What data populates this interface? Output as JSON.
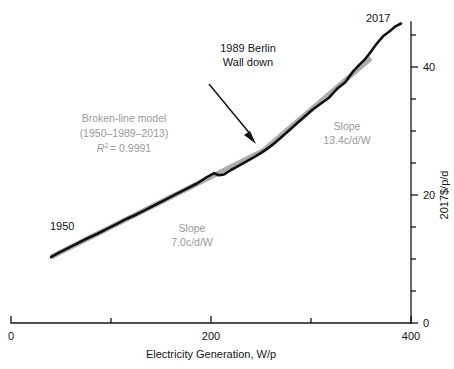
{
  "chart_data": {
    "type": "line",
    "title": "",
    "xlabel": "Electricity Generation, W/p",
    "ylabel": "2017$/p/d",
    "xlim": [
      0,
      400
    ],
    "ylim": [
      0,
      47
    ],
    "grid": false,
    "legend_position": "none",
    "x_ticks_major": [
      0,
      200,
      400
    ],
    "x_tick_labels_major": [
      "0",
      "200",
      "400"
    ],
    "x_ticks_minor": [
      100,
      300
    ],
    "y_ticks_major": [
      0,
      20,
      40
    ],
    "y_tick_labels_major": [
      "0",
      "20",
      "40"
    ],
    "y_ticks_minor": [
      5,
      10,
      15,
      25,
      30,
      35,
      45
    ],
    "y_axis_side": "right",
    "series": [
      {
        "name": "Observed trajectory",
        "color": "#111111",
        "style": "solid",
        "x": [
          40,
          48,
          57,
          66,
          76,
          86,
          96,
          106,
          116,
          126,
          136,
          146,
          156,
          166,
          176,
          186,
          196,
          203,
          208,
          213,
          220,
          228,
          236,
          244,
          250,
          256,
          262,
          270,
          278,
          286,
          294,
          302,
          310,
          318,
          326,
          334,
          342,
          348,
          354,
          360,
          366,
          372,
          378,
          384,
          390
        ],
        "y": [
          10.3,
          11.0,
          11.7,
          12.4,
          13.2,
          13.9,
          14.7,
          15.5,
          16.3,
          17.0,
          17.8,
          18.6,
          19.4,
          20.2,
          21.0,
          21.8,
          22.8,
          23.4,
          23.1,
          23.2,
          23.9,
          24.6,
          25.3,
          26.0,
          26.6,
          27.2,
          27.9,
          29.0,
          30.1,
          31.2,
          32.3,
          33.4,
          34.3,
          35.2,
          36.6,
          37.6,
          39.3,
          40.3,
          41.2,
          42.4,
          43.7,
          44.8,
          45.5,
          46.3,
          46.8
        ]
      },
      {
        "name": "Broken-line model",
        "color": "#adadad",
        "style": "solid",
        "breakpoints_x": [
          40,
          252,
          360
        ],
        "breakpoints_y": [
          10.3,
          26.9,
          41.4
        ],
        "x": [
          40,
          252,
          360
        ],
        "y": [
          10.3,
          26.9,
          41.4
        ]
      }
    ],
    "annotations": [
      {
        "name": "start-year-label",
        "text": "1950",
        "x": 48,
        "y": 14.8
      },
      {
        "name": "end-year-label",
        "text": "2017",
        "x": 370,
        "y": 47.5
      },
      {
        "name": "berlin-wall-callout",
        "text_lines": [
          "1989 Berlin",
          "Wall down"
        ],
        "arrow_from": [
          198,
          37.5
        ],
        "arrow_to": [
          248,
          28.6
        ]
      },
      {
        "name": "model-annotation",
        "text_lines": [
          "Broken-line model",
          "(1950–1989–2013)",
          "R² = 0.9991"
        ],
        "r_squared": "0.9991",
        "period": "(1950–1989–2013)",
        "color": "#9a9a9a"
      },
      {
        "name": "slope-label-lower",
        "text_lines": [
          "Slope",
          "7.0c/d/W"
        ],
        "value": "7.0c/d/W",
        "color": "#9a9a9a"
      },
      {
        "name": "slope-label-upper",
        "text_lines": [
          "Slope",
          "13.4c/d/W"
        ],
        "value": "13.4c/d/W",
        "color": "#9a9a9a"
      }
    ]
  },
  "axes": {
    "x_title": "Electricity Generation, W/p",
    "y_title": "2017$/p/d",
    "x_tick_0": "0",
    "x_tick_200": "200",
    "x_tick_400": "400",
    "y_tick_0": "0",
    "y_tick_20": "20",
    "y_tick_40": "40"
  },
  "labels": {
    "start_year": "1950",
    "end_year": "2017",
    "callout_line1": "1989 Berlin",
    "callout_line2": "Wall down",
    "model_line1": "Broken-line model",
    "model_line2": "(1950–1989–2013)",
    "model_r2_prefix": "R",
    "model_r2_exp": "2",
    "model_r2_value": "= 0.9991",
    "slope_lower_title": "Slope",
    "slope_lower_value": "7.0c/d/W",
    "slope_upper_title": "Slope",
    "slope_upper_value": "13.4c/d/W"
  },
  "colors": {
    "data_line": "#111111",
    "model_line": "#adadad",
    "annotation_gray": "#9a9a9a",
    "axis": "#141414",
    "background": "#ffffff"
  }
}
